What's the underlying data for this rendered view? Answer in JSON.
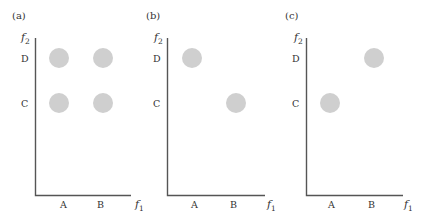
{
  "figure": {
    "panels": [
      {
        "id": "a",
        "label": "(a)",
        "x_axis_label": "f",
        "x_axis_sub": "1",
        "y_axis_label": "f",
        "y_axis_sub": "2",
        "x_ticks": [
          "A",
          "B"
        ],
        "y_ticks": [
          "D",
          "C"
        ],
        "points": [
          {
            "x": "A",
            "y": "D"
          },
          {
            "x": "B",
            "y": "D"
          },
          {
            "x": "A",
            "y": "C"
          },
          {
            "x": "B",
            "y": "C"
          }
        ]
      },
      {
        "id": "b",
        "label": "(b)",
        "x_axis_label": "f",
        "x_axis_sub": "1",
        "y_axis_label": "f",
        "y_axis_sub": "2",
        "x_ticks": [
          "A",
          "B"
        ],
        "y_ticks": [
          "D",
          "C"
        ],
        "points": [
          {
            "x": "A",
            "y": "D"
          },
          {
            "x": "B",
            "y": "C"
          }
        ]
      },
      {
        "id": "c",
        "label": "(c)",
        "x_axis_label": "f",
        "x_axis_sub": "1",
        "y_axis_label": "f",
        "y_axis_sub": "2",
        "x_ticks": [
          "A",
          "B"
        ],
        "y_ticks": [
          "D",
          "C"
        ],
        "points": [
          {
            "x": "B",
            "y": "D"
          },
          {
            "x": "A",
            "y": "C"
          }
        ]
      }
    ],
    "colors": {
      "dot_fill": "#cfcfcf",
      "axis": "#555555",
      "text": "#333333"
    }
  }
}
